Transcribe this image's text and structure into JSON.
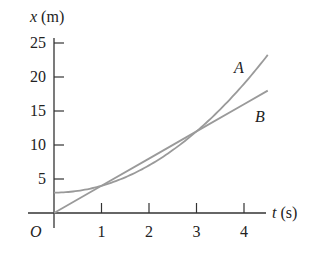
{
  "chart_data": {
    "type": "line",
    "title": "",
    "xlabel": "t (s)",
    "ylabel": "x (m)",
    "xlabel_var": "t",
    "xlabel_unit": "(s)",
    "ylabel_var": "x",
    "ylabel_unit": "(m)",
    "origin_label": "O",
    "xlim": [
      0,
      4.5
    ],
    "ylim": [
      0,
      25
    ],
    "x_ticks": [
      1,
      2,
      3,
      4
    ],
    "y_ticks": [
      5,
      10,
      15,
      20,
      25
    ],
    "grid": false,
    "legend": "inline labels",
    "series": [
      {
        "name": "A",
        "description": "x = 3 + t^2 (parabola)",
        "x": [
          0,
          0.5,
          1,
          1.5,
          2,
          2.5,
          3,
          3.5,
          4,
          4.5
        ],
        "values": [
          3,
          3.25,
          4,
          5.25,
          7,
          9.25,
          12,
          15.25,
          19,
          23.25
        ]
      },
      {
        "name": "B",
        "description": "x = 4t (straight line)",
        "x": [
          0,
          1,
          2,
          3,
          4,
          4.5
        ],
        "values": [
          0,
          4,
          8,
          12,
          16,
          18
        ]
      }
    ],
    "colors": {
      "curve": "#9a9a9a",
      "axis": "#333333",
      "text": "#222222"
    }
  }
}
